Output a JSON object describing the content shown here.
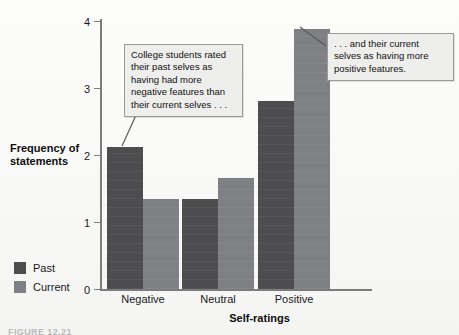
{
  "chart_data": {
    "type": "bar",
    "title": "",
    "xlabel": "Self-ratings",
    "ylabel": "Frequency of statements",
    "ylabel_line1": "Frequency of",
    "ylabel_line2": "statements",
    "categories": [
      "Negative",
      "Neutral",
      "Positive"
    ],
    "series": [
      {
        "name": "Past",
        "values": [
          2.12,
          1.34,
          2.8
        ],
        "color": "#4d4d4f"
      },
      {
        "name": "Current",
        "values": [
          1.34,
          1.65,
          3.88
        ],
        "color": "#7f8083"
      }
    ],
    "ylim": [
      0,
      4
    ],
    "yticks": [
      "0",
      "1",
      "2",
      "3",
      "4"
    ],
    "grid": false,
    "legend_position": "bottom-left"
  },
  "annotations": [
    {
      "id": "left",
      "text": "College students rated their past selves as having had more negative features than their current selves . . .",
      "target": "Negative / Past bar"
    },
    {
      "id": "right",
      "text": ". . . and their current selves as having more positive features.",
      "target": "Positive / Current bar"
    }
  ],
  "legend": {
    "items": [
      {
        "label": "Past",
        "color": "#4d4d4f"
      },
      {
        "label": "Current",
        "color": "#7f8083"
      }
    ]
  },
  "caption_remnant": "FIGURE 12.21"
}
